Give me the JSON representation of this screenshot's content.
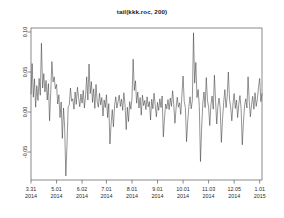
{
  "chart_data": {
    "type": "line",
    "title": "tail(kkk.roc, 200)",
    "xlabel": "",
    "ylabel": "",
    "grid": false,
    "legend": false,
    "legend_position": "none",
    "line_color": "#3d3d3d",
    "frame_color": "#5a5a5a",
    "background": "#ffffff",
    "ylim": [
      -0.085,
      0.105
    ],
    "yticks": [
      0.1,
      0.05,
      0.0,
      -0.05
    ],
    "ytick_labels": [
      "0.10",
      "0.05",
      "0.00",
      "-0.05"
    ],
    "xlim": [
      0,
      199
    ],
    "xtick_positions": [
      0,
      22,
      44,
      65,
      87,
      109,
      131,
      153,
      175,
      197
    ],
    "xtick_labels": [
      {
        "date": "3.31",
        "year": "2014"
      },
      {
        "date": "5.01",
        "year": "2014"
      },
      {
        "date": "6.02",
        "year": "2014"
      },
      {
        "date": "7.01",
        "year": "2014"
      },
      {
        "date": "8.01",
        "year": "2014"
      },
      {
        "date": "9.01",
        "year": "2014"
      },
      {
        "date": "10.01",
        "year": "2014"
      },
      {
        "date": "11.03",
        "year": "2014"
      },
      {
        "date": "12.05",
        "year": "2014"
      },
      {
        "date": "1.01",
        "year": "2015"
      }
    ],
    "n_points": 200,
    "values": [
      0.0225,
      0.0605,
      0.0185,
      0.0415,
      0.006,
      0.033,
      0.0145,
      0.042,
      0.021,
      0.086,
      0.03,
      0.048,
      0.025,
      0.0395,
      0.015,
      0.0355,
      -0.011,
      0.024,
      0.063,
      0.0375,
      0.044,
      0.029,
      0.0345,
      0.01,
      0.0215,
      -0.007,
      0.0125,
      -0.033,
      0.005,
      -0.019,
      -0.08,
      -0.042,
      0.006,
      0.009,
      0.03,
      0.0135,
      0.0165,
      0.0035,
      0.025,
      0.0095,
      0.031,
      0.018,
      0.0065,
      0.0225,
      0.011,
      0.027,
      0.005,
      0.02,
      0.044,
      0.015,
      0.06,
      0.023,
      0.038,
      0.012,
      0.029,
      0.0045,
      0.0345,
      0.0135,
      0.006,
      0.0235,
      0.009,
      0.018,
      -0.005,
      0.015,
      0.0055,
      0.0215,
      -0.007,
      0.0105,
      -0.04,
      -0.015,
      0.003,
      -0.0185,
      0.008,
      0.019,
      0.005,
      0.013,
      0.021,
      0.007,
      0.016,
      0.002,
      0.024,
      0.009,
      -0.022,
      0.006,
      -0.012,
      0.013,
      0.0035,
      0.0175,
      0.066,
      0.027,
      0.039,
      0.011,
      0.025,
      0.005,
      0.018,
      -0.004,
      0.021,
      0.008,
      0.0145,
      0.003,
      0.019,
      0.0065,
      0.013,
      -0.01,
      0.016,
      0.004,
      0.0235,
      0.0085,
      -0.006,
      0.012,
      0.002,
      0.0165,
      0.0055,
      0.02,
      -0.031,
      -0.008,
      0.01,
      0.004,
      0.0155,
      0.003,
      0.0175,
      0.007,
      0.0265,
      0.009,
      -0.014,
      0.005,
      0.0185,
      0.006,
      0.0115,
      -0.003,
      0.021,
      0.045,
      0.013,
      0.0055,
      -0.037,
      -0.012,
      0.007,
      0.019,
      0.004,
      0.0145,
      0.099,
      0.036,
      0.062,
      0.018,
      0.028,
      0.007,
      -0.062,
      -0.02,
      0.011,
      0.025,
      0.0055,
      0.043,
      0.015,
      0.006,
      -0.017,
      0.009,
      0.02,
      0.0035,
      0.046,
      0.014,
      -0.015,
      0.007,
      0.0175,
      0.0045,
      -0.038,
      -0.009,
      0.012,
      0.028,
      0.0055,
      0.019,
      0.05,
      0.016,
      0.006,
      -0.011,
      0.01,
      0.023,
      0.0045,
      0.015,
      -0.007,
      0.0095,
      0.0205,
      0.004,
      -0.041,
      -0.013,
      0.008,
      0.0165,
      0.005,
      0.044,
      0.0135,
      -0.006,
      0.009,
      0.0195,
      0.0035,
      0.024,
      0.007,
      0.016,
      0.031,
      0.042,
      0.013,
      0.023
    ]
  }
}
